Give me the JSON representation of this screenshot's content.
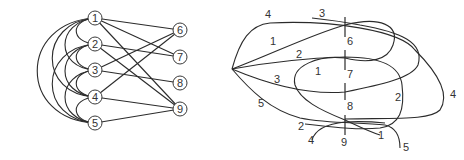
{
  "left_graph": {
    "description": "Bipartite-style graph; left column nodes 1-5 connected by arcs, straight edges to right column nodes 6-9",
    "nodes": [
      {
        "id": "1",
        "x": 95,
        "y": 18
      },
      {
        "id": "2",
        "x": 95,
        "y": 44
      },
      {
        "id": "3",
        "x": 95,
        "y": 70
      },
      {
        "id": "4",
        "x": 95,
        "y": 97
      },
      {
        "id": "5",
        "x": 95,
        "y": 123
      },
      {
        "id": "6",
        "x": 180,
        "y": 30
      },
      {
        "id": "7",
        "x": 180,
        "y": 57
      },
      {
        "id": "8",
        "x": 180,
        "y": 83
      },
      {
        "id": "9",
        "x": 180,
        "y": 109
      }
    ],
    "straight_edges": [
      [
        "1",
        "6"
      ],
      [
        "1",
        "7"
      ],
      [
        "1",
        "9"
      ],
      [
        "2",
        "7"
      ],
      [
        "2",
        "9"
      ],
      [
        "3",
        "6"
      ],
      [
        "3",
        "8"
      ],
      [
        "4",
        "6"
      ],
      [
        "4",
        "9"
      ],
      [
        "5",
        "9"
      ]
    ],
    "arc_edges": [
      [
        "1",
        "2"
      ],
      [
        "1",
        "3"
      ],
      [
        "1",
        "4"
      ],
      [
        "1",
        "5"
      ],
      [
        "2",
        "3"
      ],
      [
        "2",
        "4"
      ],
      [
        "2",
        "5"
      ],
      [
        "3",
        "4"
      ],
      [
        "3",
        "5"
      ],
      [
        "4",
        "5"
      ]
    ]
  },
  "right_graph": {
    "description": "Drawing of the same graph with curves from a common apex to vertical tick marks",
    "ticks": [
      {
        "label": "6",
        "x": 345,
        "y1": 17,
        "y2": 37,
        "label_x": 348,
        "label_y": 45
      },
      {
        "label": "7",
        "x": 345,
        "y1": 50,
        "y2": 70,
        "label_x": 348,
        "label_y": 78
      },
      {
        "label": "8",
        "x": 345,
        "y1": 83,
        "y2": 100,
        "label_x": 348,
        "label_y": 110
      },
      {
        "label": "9",
        "x": 345,
        "y1": 115,
        "y2": 135,
        "label_x": 340,
        "label_y": 145
      }
    ],
    "curve_labels": [
      {
        "text": "4",
        "x": 265,
        "y": 18
      },
      {
        "text": "3",
        "x": 319,
        "y": 17
      },
      {
        "text": "1",
        "x": 270,
        "y": 45
      },
      {
        "text": "2",
        "x": 296,
        "y": 58
      },
      {
        "text": "1",
        "x": 315,
        "y": 75
      },
      {
        "text": "3",
        "x": 274,
        "y": 83
      },
      {
        "text": "5",
        "x": 258,
        "y": 107
      },
      {
        "text": "2",
        "x": 395,
        "y": 101
      },
      {
        "text": "4",
        "x": 450,
        "y": 98
      },
      {
        "text": "2",
        "x": 298,
        "y": 130
      },
      {
        "text": "4",
        "x": 308,
        "y": 144
      },
      {
        "text": "1",
        "x": 378,
        "y": 139
      },
      {
        "text": "5",
        "x": 403,
        "y": 151
      }
    ]
  }
}
